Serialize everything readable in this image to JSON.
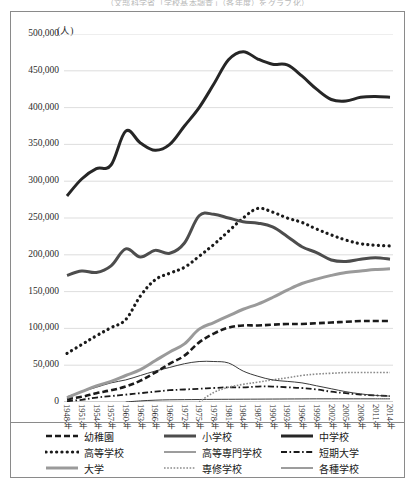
{
  "source_caption": "（文部科学省「学校基本調査」（各年度）をグラフ化）",
  "axis": {
    "unit_label": "(人)",
    "y_ticks": [
      "500,000",
      "450,000",
      "400,000",
      "350,000",
      "300,000",
      "250,000",
      "200,000",
      "150,000",
      "100,000",
      "50,000",
      "0"
    ],
    "x_ticks": [
      "1948年",
      "1951年",
      "1954年",
      "1957年",
      "1960年",
      "1963年",
      "1966年",
      "1969年",
      "1972年",
      "1975年",
      "1978年",
      "1981年",
      "1984年",
      "1987年",
      "1990年",
      "1993年",
      "1996年",
      "1999年",
      "2002年",
      "2005年",
      "2008年",
      "2011年",
      "2014年"
    ]
  },
  "legend": {
    "items": [
      {
        "label": "幼稚園",
        "style": "dashed-thin",
        "color": "#1a1a1a"
      },
      {
        "label": "小学校",
        "style": "solid-thick",
        "color": "#4d4d4d"
      },
      {
        "label": "中学校",
        "style": "solid-thick",
        "color": "#262626"
      },
      {
        "label": "高等学校",
        "style": "dotted-thick",
        "color": "#1a1a1a"
      },
      {
        "label": "高等専門学校",
        "style": "solid-thin",
        "color": "#3a3a3a"
      },
      {
        "label": "短期大学",
        "style": "dash-dot",
        "color": "#1a1a1a"
      },
      {
        "label": "大学",
        "style": "solid-thick",
        "color": "#9a9a9a"
      },
      {
        "label": "専修学校",
        "style": "dotted-fine",
        "color": "#8a8a8a"
      },
      {
        "label": "各種学校",
        "style": "solid-thin",
        "color": "#3a3a3a"
      }
    ]
  },
  "colors": {
    "frame": "#8a8a8a",
    "gridline": "#d4d4d4",
    "text": "#1a1a1a",
    "gray_series": "#9a9a9a",
    "dark_series": "#262626"
  },
  "chart_data": {
    "type": "line",
    "title": "",
    "xlabel": "",
    "ylabel": "(人)",
    "ylim": [
      0,
      500000
    ],
    "ytick_interval": 50000,
    "grid": true,
    "legend_position": "bottom",
    "x": [
      1948,
      1951,
      1954,
      1957,
      1960,
      1963,
      1966,
      1969,
      1972,
      1975,
      1978,
      1981,
      1984,
      1987,
      1990,
      1993,
      1996,
      1999,
      2002,
      2005,
      2008,
      2011,
      2014
    ],
    "series": [
      {
        "name": "中学校",
        "values": [
          280000,
          303000,
          317000,
          322000,
          368000,
          352000,
          342000,
          350000,
          375000,
          400000,
          432000,
          465000,
          476000,
          466000,
          459000,
          458000,
          443000,
          425000,
          411000,
          409000,
          414000,
          415000,
          414000
        ]
      },
      {
        "name": "小学校",
        "values": [
          172000,
          178000,
          176000,
          185000,
          208000,
          197000,
          206000,
          202000,
          216000,
          253000,
          255000,
          250000,
          245000,
          243000,
          238000,
          225000,
          211000,
          203000,
          193000,
          191000,
          194000,
          196000,
          194000
        ]
      },
      {
        "name": "高等学校",
        "values": [
          66000,
          78000,
          90000,
          101000,
          112000,
          144000,
          166000,
          175000,
          183000,
          198000,
          214000,
          232000,
          250000,
          263000,
          258000,
          250000,
          244000,
          235000,
          227000,
          220000,
          215000,
          213000,
          212000
        ]
      },
      {
        "name": "大学",
        "values": [
          6000,
          14000,
          22000,
          28000,
          36000,
          44000,
          56000,
          68000,
          79000,
          99000,
          108000,
          117000,
          126000,
          133000,
          142000,
          152000,
          161000,
          167000,
          172000,
          176000,
          178000,
          180000,
          181000
        ]
      },
      {
        "name": "幼稚園",
        "values": [
          4000,
          7000,
          12000,
          16000,
          21000,
          29000,
          40000,
          52000,
          63000,
          81000,
          93000,
          101000,
          104000,
          104000,
          105000,
          106000,
          106000,
          107000,
          108000,
          109000,
          110000,
          110000,
          110000
        ]
      },
      {
        "name": "各種学校",
        "values": [
          7000,
          14000,
          20000,
          26000,
          30000,
          36000,
          42000,
          47000,
          52000,
          55000,
          55000,
          53000,
          42000,
          35000,
          30000,
          28000,
          26000,
          22000,
          18000,
          14000,
          11000,
          9000,
          8000
        ]
      },
      {
        "name": "専修学校",
        "values": [
          0,
          0,
          0,
          0,
          0,
          0,
          0,
          0,
          0,
          0,
          13000,
          20000,
          24000,
          27000,
          30000,
          33000,
          36000,
          38000,
          39000,
          40000,
          40000,
          40000,
          40000
        ]
      },
      {
        "name": "短期大学",
        "values": [
          1000,
          3000,
          6000,
          8000,
          10000,
          12000,
          14000,
          16000,
          17000,
          18000,
          19000,
          20000,
          20000,
          21000,
          21000,
          20000,
          19000,
          17000,
          14000,
          12000,
          10000,
          9000,
          8000
        ]
      },
      {
        "name": "高等専門学校",
        "values": [
          0,
          0,
          0,
          0,
          0,
          1500,
          2500,
          3000,
          3200,
          3400,
          3600,
          3700,
          3800,
          3900,
          4000,
          4100,
          4200,
          4300,
          4300,
          4300,
          4300,
          4300,
          4300
        ]
      }
    ]
  }
}
